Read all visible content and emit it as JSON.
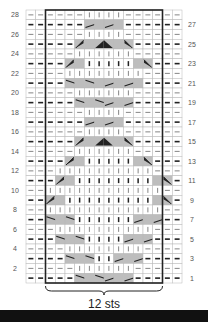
{
  "chart_title": "",
  "stitch_label": "12 sts",
  "colors": {
    "shade": "#bdbdbd",
    "line": "#222222",
    "grid": "#b8b8b8",
    "box": "#222222"
  },
  "rows_left_labels": [
    "28",
    "26",
    "24",
    "22",
    "20",
    "18",
    "16",
    "14",
    "12",
    "10",
    "8",
    "6",
    "4",
    "2"
  ],
  "rows_right_labels": [
    "27",
    "25",
    "23",
    "21",
    "19",
    "17",
    "15",
    "13",
    "11",
    "9",
    "7",
    "5",
    "3",
    "1"
  ],
  "legend": {
    "-": "purl",
    "|": "knit",
    "/": "right cross",
    "\\": "left cross",
    "a": "right purl cross",
    "b": "left purl cross",
    "A": "center cross left",
    "B": "center cross right",
    "s": "shaded"
  },
  "grid": [
    "------||||------",
    "------/s/s------",
    "------||||------",
    "-----asABsb-----",
    "-----||||||-----",
    "----as|||||sb---",
    "----||||||||----",
    "----\\s\\s/s/s----",
    "-----||||||-----",
    "-----\\s\\/s/-----",
    "------||||------",
    "------/s/s------",
    "------||||------",
    "-----asABsb-----",
    "-----||||||-----",
    "----as|||||sb---",
    "---||||||||||---",
    "---as||||||||sb-",
    "--||||||||||||--",
    "--as|||||||||sb-",
    "--||||||||||||--",
    "--\\s\\||||||/s/-",
    "---||||||||||---",
    "---\\s\\||||/s/--",
    "----||||||||----",
    "----\\s\\||/s/---",
    "-----||||||-----",
    "-----\\s\\/s/----"
  ]
}
